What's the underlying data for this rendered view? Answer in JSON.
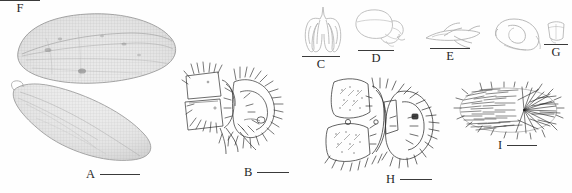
{
  "figure": {
    "type": "scientific-plate",
    "panel_count": 9,
    "background_color": "#ffffff",
    "ink_color": "#2b2b2b",
    "light_ink_color": "#b8b8b8"
  },
  "panels": [
    {
      "id": "A",
      "label": "A",
      "subject": "wings",
      "style": "halftone-photograph",
      "scalebar": {
        "orientation": "horizontal",
        "position": "right-of-label",
        "length_px": 40
      }
    },
    {
      "id": "B",
      "label": "B",
      "subject": "male-genitalia-lateral",
      "style": "line-drawing-setose",
      "scalebar": {
        "orientation": "horizontal",
        "position": "right-of-label",
        "length_px": 32
      }
    },
    {
      "id": "C",
      "label": "C",
      "subject": "aedeagal-complex-ventral",
      "style": "line-drawing-outline",
      "scalebar": {
        "orientation": "horizontal",
        "position": "above-label",
        "length_px": 38
      }
    },
    {
      "id": "D",
      "label": "D",
      "subject": "genital-capsule-lateral",
      "style": "line-drawing-outline",
      "scalebar": {
        "orientation": "horizontal",
        "position": "above-label",
        "length_px": 36
      }
    },
    {
      "id": "E",
      "label": "E",
      "subject": "paramere-branched",
      "style": "line-drawing-outline",
      "scalebar": {
        "orientation": "horizontal",
        "position": "above-label",
        "length_px": 40
      }
    },
    {
      "id": "F",
      "label": "F",
      "subject": "hook-shaped-sclerite",
      "style": "line-drawing-outline",
      "scalebar": {
        "orientation": "horizontal",
        "position": "above-label",
        "length_px": 40
      }
    },
    {
      "id": "G",
      "label": "G",
      "subject": "small-plate-sclerite",
      "style": "line-drawing-outline",
      "scalebar": {
        "orientation": "horizontal",
        "position": "above-label",
        "length_px": 24
      }
    },
    {
      "id": "H",
      "label": "H",
      "subject": "genitalia-with-stipes",
      "style": "line-drawing-setose",
      "scalebar": {
        "orientation": "horizontal",
        "position": "right-of-label",
        "length_px": 32
      }
    },
    {
      "id": "I",
      "label": "I",
      "subject": "setose-oval-structure",
      "style": "line-drawing-setose",
      "scalebar": {
        "orientation": "horizontal",
        "position": "right-of-label",
        "length_px": 30
      }
    }
  ]
}
